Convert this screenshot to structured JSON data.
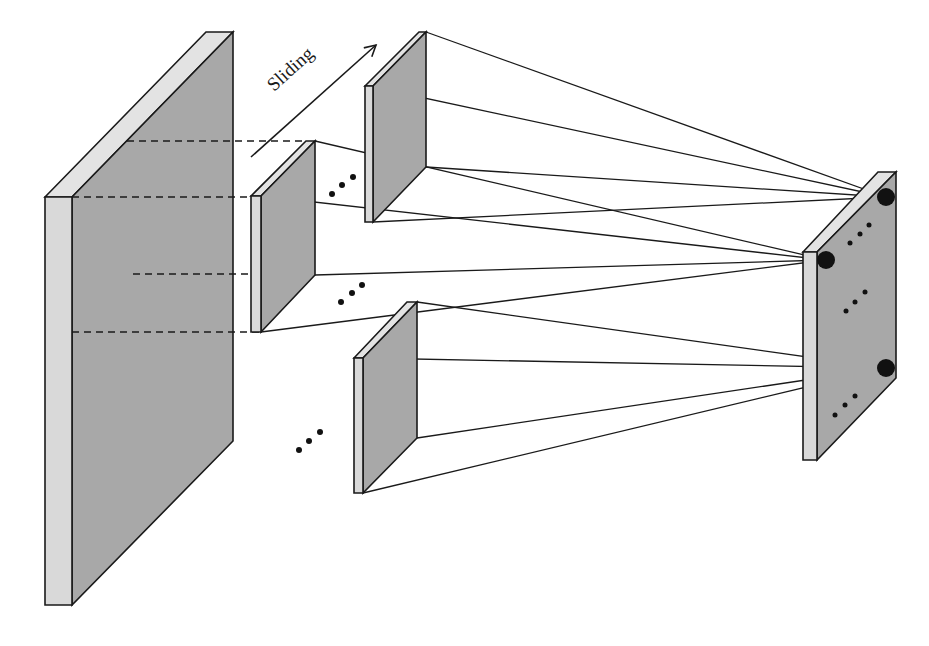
{
  "diagram": {
    "type": "sliding-window-convolution",
    "arrow_label": "Sliding",
    "colors": {
      "slab_face": "#a8a8a8",
      "slab_edge": "#d9d9d9",
      "line": "#1a1a1a",
      "node": "#111111",
      "background": "#ffffff"
    },
    "components": [
      {
        "id": "input-volume",
        "label": "Input feature map (large slab)"
      },
      {
        "id": "window-top",
        "label": "Sliding window patch (top)"
      },
      {
        "id": "window-middle",
        "label": "Sliding window patch (middle)"
      },
      {
        "id": "window-bottom",
        "label": "Sliding window patch (bottom)"
      },
      {
        "id": "output-map",
        "label": "Output feature map with nodes"
      }
    ],
    "ellipses": [
      "•••",
      "•••",
      "•••",
      "•••",
      "•••",
      "•••"
    ],
    "edges": [
      {
        "from": "window-top",
        "to": "output-node-1"
      },
      {
        "from": "window-middle",
        "to": "output-node-2"
      },
      {
        "from": "window-bottom",
        "to": "output-node-3"
      }
    ]
  }
}
